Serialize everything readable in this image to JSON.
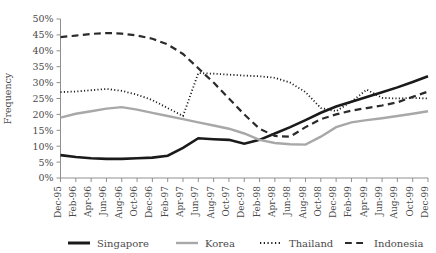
{
  "chart_data": {
    "type": "line",
    "title": "",
    "xlabel": "",
    "ylabel": "Frequency",
    "ylim": [
      0,
      50
    ],
    "ytick_step": 5,
    "grid": false,
    "legend_position": "bottom",
    "ytick_labels": [
      "0%",
      "5%",
      "10%",
      "15%",
      "20%",
      "25%",
      "30%",
      "35%",
      "40%",
      "45%",
      "50%"
    ],
    "categories": [
      "Dec-95",
      "Feb-96",
      "Apr-96",
      "Jun-96",
      "Aug-96",
      "Oct-96",
      "Dec-96",
      "Feb-97",
      "Apr-97",
      "Jun-97",
      "Aug-97",
      "Oct-97",
      "Dec-97",
      "Feb-98",
      "Apr-98",
      "Jun-98",
      "Aug-98",
      "Oct-98",
      "Dec-98",
      "Feb-99",
      "Apr-99",
      "Jun-99",
      "Aug-99",
      "Oct-99",
      "Dec-99"
    ],
    "series": [
      {
        "name": "Singapore",
        "color": "#1a1a1a",
        "style": "solid",
        "width": 2.6,
        "values": [
          7.2,
          6.6,
          6.2,
          6.0,
          6.0,
          6.2,
          6.4,
          7.0,
          9.5,
          12.5,
          12.2,
          12.0,
          10.8,
          12.0,
          14.0,
          16.0,
          18.2,
          20.5,
          22.5,
          24.0,
          25.5,
          27.0,
          28.5,
          30.2,
          32.0
        ]
      },
      {
        "name": "Korea",
        "color": "#a8a8a8",
        "style": "solid",
        "width": 2.4,
        "values": [
          19.0,
          20.2,
          21.0,
          21.8,
          22.3,
          21.5,
          20.5,
          19.5,
          18.5,
          17.5,
          16.5,
          15.5,
          14.0,
          12.0,
          11.0,
          10.6,
          10.5,
          13.0,
          16.0,
          17.5,
          18.2,
          18.8,
          19.5,
          20.2,
          21.0
        ]
      },
      {
        "name": "Thailand",
        "color": "#1a1a1a",
        "style": "dotted",
        "width": 1.8,
        "values": [
          27.0,
          27.2,
          27.6,
          28.0,
          27.4,
          26.2,
          24.5,
          22.0,
          19.5,
          33.0,
          32.8,
          32.5,
          32.2,
          32.0,
          31.5,
          30.0,
          27.0,
          22.0,
          21.0,
          24.0,
          27.8,
          25.2,
          25.0,
          25.2,
          25.0
        ]
      },
      {
        "name": "Indonesia",
        "color": "#2b2b2b",
        "style": "dashed",
        "width": 2.2,
        "values": [
          44.3,
          44.8,
          45.3,
          45.6,
          45.4,
          44.8,
          43.8,
          42.0,
          39.0,
          34.5,
          30.0,
          25.0,
          20.0,
          15.5,
          13.2,
          13.0,
          16.0,
          18.5,
          20.0,
          21.2,
          22.0,
          22.8,
          23.8,
          25.5,
          27.2
        ]
      }
    ]
  },
  "legend": {
    "items": [
      {
        "label": "Singapore",
        "color": "#1a1a1a",
        "style": "solid",
        "width": 3.0
      },
      {
        "label": "Korea",
        "color": "#a8a8a8",
        "style": "solid",
        "width": 2.4
      },
      {
        "label": "Thailand",
        "color": "#1a1a1a",
        "style": "dotted",
        "width": 2.0
      },
      {
        "label": "Indonesia",
        "color": "#2b2b2b",
        "style": "dashed",
        "width": 2.2
      }
    ]
  }
}
